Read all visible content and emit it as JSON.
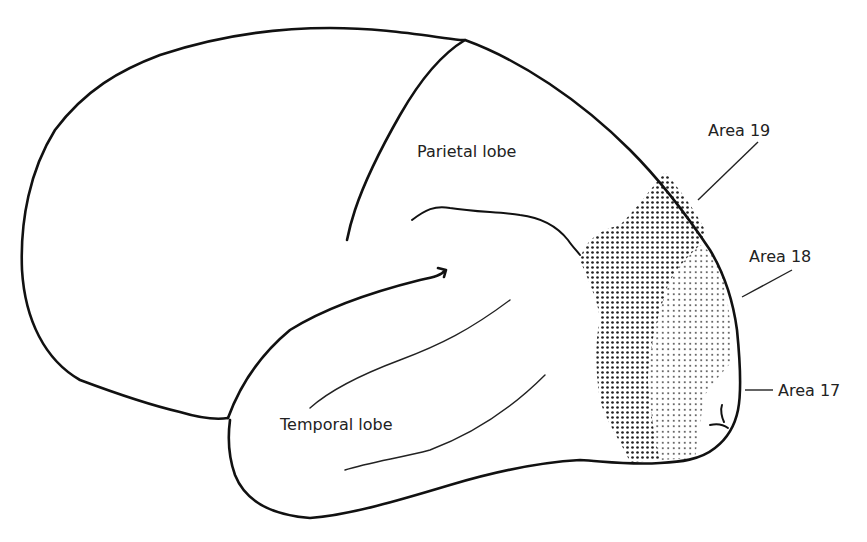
{
  "diagram": {
    "labels": {
      "parietal": "Parietal lobe",
      "temporal": "Temporal lobe",
      "area19": "Area 19",
      "area18": "Area 18",
      "area17": "Area 17"
    },
    "regions": [
      {
        "id": "area19",
        "shading": "dense stipple",
        "color": "#555555"
      },
      {
        "id": "area18",
        "shading": "light stipple",
        "color": "#9a9a9a"
      },
      {
        "id": "area17",
        "shading": "none",
        "color": "#ffffff"
      }
    ],
    "colors": {
      "outline": "#111111",
      "background": "#ffffff"
    }
  }
}
